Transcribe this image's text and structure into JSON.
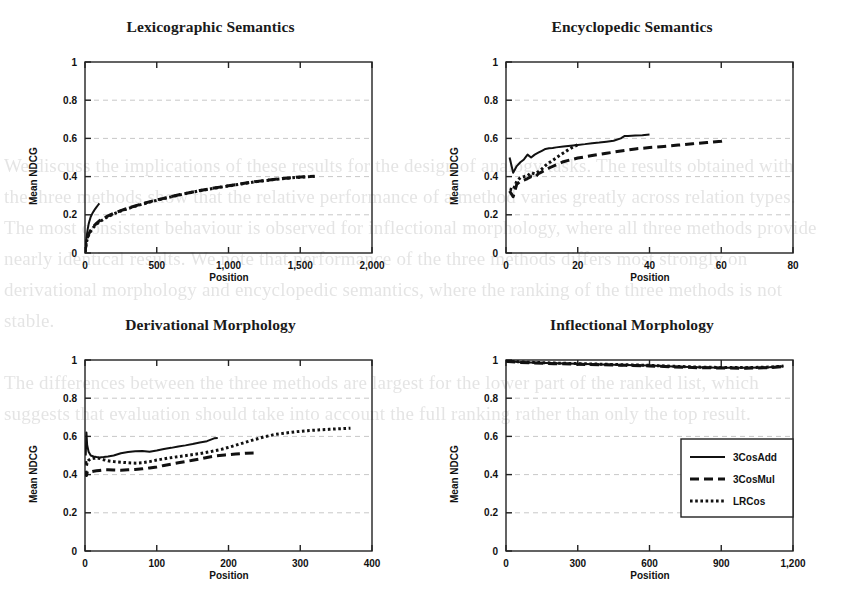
{
  "figure": {
    "background_text": "We discuss the implications of these results for the design of analogy tasks. The results obtained with the three methods show that the relative performance of a method varies greatly across relation types. The most consistent behaviour is observed for inflectional morphology, where all three methods provide nearly identical results. We note that performance of the three methods differs most strongly on derivational morphology and encyclopedic semantics, where the ranking of the three methods is not stable.\n\nThe differences between the three methods are largest for the lower part of the ranked list, which suggests that evaluation should take into account the full ranking rather than only the top result.",
    "series_colors": {
      "line": "#111111",
      "grid": "#c8c8c8",
      "axis": "#222222"
    },
    "legend": {
      "entries": [
        {
          "label": "3CosAdd",
          "style": "solid"
        },
        {
          "label": "3CosMul",
          "style": "dashed"
        },
        {
          "label": "LRCos",
          "style": "dotted"
        }
      ]
    }
  },
  "chart_data": [
    {
      "type": "line",
      "title": "Lexicographic Semantics",
      "xlabel": "Position",
      "ylabel": "Mean NDCG",
      "xlim": [
        0,
        2000
      ],
      "ylim": [
        0,
        1
      ],
      "xticks": [
        0,
        500,
        1000,
        1500,
        2000
      ],
      "xticklabels": [
        "0",
        "500",
        "1,000",
        "1,500",
        "2,000"
      ],
      "yticks": [
        0,
        0.2,
        0.4,
        0.6,
        0.8,
        1
      ],
      "yticklabels": [
        "0",
        "0.2",
        "0.4",
        "0.6",
        "0.8",
        "1"
      ],
      "grid": "horizontal-dashed",
      "legend": "none",
      "series": [
        {
          "name": "3CosAdd",
          "style": "solid",
          "x": [
            1,
            5,
            10,
            15,
            20,
            25,
            30,
            40,
            50,
            60,
            70,
            80,
            90,
            100
          ],
          "y": [
            0.005,
            0.04,
            0.075,
            0.105,
            0.13,
            0.15,
            0.165,
            0.19,
            0.205,
            0.218,
            0.23,
            0.24,
            0.25,
            0.26
          ]
        },
        {
          "name": "3CosMul",
          "style": "dashed",
          "x": [
            1,
            5,
            10,
            20,
            40,
            60,
            80,
            100,
            150,
            200,
            250,
            300,
            400,
            500,
            600,
            700,
            800,
            900,
            1000,
            1100,
            1200,
            1300,
            1400,
            1500,
            1600
          ],
          "y": [
            0.005,
            0.035,
            0.06,
            0.09,
            0.12,
            0.14,
            0.155,
            0.168,
            0.19,
            0.208,
            0.222,
            0.235,
            0.258,
            0.278,
            0.295,
            0.312,
            0.327,
            0.34,
            0.352,
            0.364,
            0.375,
            0.384,
            0.392,
            0.398,
            0.402
          ]
        },
        {
          "name": "LRCos",
          "style": "dotted",
          "x": [
            1,
            5,
            10,
            20,
            40,
            60,
            80,
            100,
            150,
            200,
            250,
            300,
            400,
            500,
            600,
            700,
            800,
            900,
            1000,
            1100,
            1200,
            1300,
            1400,
            1500,
            1600
          ],
          "y": [
            0.004,
            0.03,
            0.055,
            0.085,
            0.115,
            0.135,
            0.15,
            0.163,
            0.186,
            0.205,
            0.22,
            0.233,
            0.256,
            0.276,
            0.294,
            0.311,
            0.326,
            0.339,
            0.351,
            0.363,
            0.374,
            0.383,
            0.391,
            0.397,
            0.401
          ]
        }
      ]
    },
    {
      "type": "line",
      "title": "Encyclopedic Semantics",
      "xlabel": "Position",
      "ylabel": "Mean NDCG",
      "xlim": [
        0,
        80
      ],
      "ylim": [
        0,
        1
      ],
      "xticks": [
        0,
        20,
        40,
        60,
        80
      ],
      "xticklabels": [
        "0",
        "20",
        "40",
        "60",
        "80"
      ],
      "yticks": [
        0,
        0.2,
        0.4,
        0.6,
        0.8,
        1
      ],
      "yticklabels": [
        "0",
        "0.2",
        "0.4",
        "0.6",
        "0.8",
        "1"
      ],
      "grid": "horizontal-dashed",
      "legend": "none",
      "series": [
        {
          "name": "3CosAdd",
          "style": "solid",
          "x": [
            1,
            2,
            3,
            4,
            5,
            6,
            7,
            8,
            9,
            10,
            11,
            12,
            13,
            14,
            16,
            18,
            20,
            22,
            24,
            26,
            28,
            30,
            32,
            33,
            34,
            36,
            38,
            40
          ],
          "y": [
            0.5,
            0.42,
            0.455,
            0.475,
            0.49,
            0.515,
            0.5,
            0.515,
            0.525,
            0.535,
            0.545,
            0.548,
            0.55,
            0.553,
            0.558,
            0.562,
            0.566,
            0.57,
            0.575,
            0.578,
            0.583,
            0.588,
            0.6,
            0.612,
            0.613,
            0.615,
            0.617,
            0.62
          ]
        },
        {
          "name": "3CosMul",
          "style": "dashed",
          "x": [
            1,
            2,
            3,
            4,
            5,
            6,
            7,
            8,
            9,
            10,
            12,
            14,
            16,
            18,
            20,
            24,
            28,
            32,
            36,
            40,
            44,
            48,
            52,
            56,
            60,
            61
          ],
          "y": [
            0.325,
            0.295,
            0.36,
            0.375,
            0.382,
            0.39,
            0.4,
            0.395,
            0.415,
            0.425,
            0.445,
            0.462,
            0.478,
            0.488,
            0.497,
            0.51,
            0.522,
            0.534,
            0.545,
            0.552,
            0.558,
            0.565,
            0.572,
            0.578,
            0.585,
            0.59
          ]
        },
        {
          "name": "LRCos",
          "style": "dotted",
          "x": [
            1,
            2,
            3,
            4,
            5,
            6,
            7,
            8,
            9,
            10,
            11,
            12,
            13,
            14,
            15,
            16,
            17,
            18,
            19,
            20
          ],
          "y": [
            0.335,
            0.33,
            0.375,
            0.395,
            0.4,
            0.405,
            0.42,
            0.415,
            0.425,
            0.44,
            0.458,
            0.472,
            0.485,
            0.498,
            0.512,
            0.524,
            0.536,
            0.548,
            0.558,
            0.566
          ]
        }
      ]
    },
    {
      "type": "line",
      "title": "Derivational Morphology",
      "xlabel": "Position",
      "ylabel": "Mean NDCG",
      "xlim": [
        0,
        400
      ],
      "ylim": [
        0,
        1
      ],
      "xticks": [
        0,
        100,
        200,
        300,
        400
      ],
      "xticklabels": [
        "0",
        "100",
        "200",
        "300",
        "400"
      ],
      "yticks": [
        0,
        0.2,
        0.4,
        0.6,
        0.8,
        1
      ],
      "yticklabels": [
        "0",
        "0.2",
        "0.4",
        "0.6",
        "0.8",
        "1"
      ],
      "grid": "horizontal-dashed",
      "legend": "none",
      "series": [
        {
          "name": "3CosAdd",
          "style": "solid",
          "x": [
            1,
            2,
            3,
            5,
            8,
            12,
            16,
            20,
            26,
            32,
            40,
            50,
            60,
            70,
            80,
            90,
            100,
            110,
            120,
            130,
            140,
            150,
            160,
            170,
            180,
            185
          ],
          "y": [
            0.5,
            0.62,
            0.555,
            0.52,
            0.5,
            0.495,
            0.492,
            0.49,
            0.492,
            0.495,
            0.5,
            0.512,
            0.518,
            0.522,
            0.524,
            0.52,
            0.526,
            0.534,
            0.54,
            0.547,
            0.553,
            0.56,
            0.568,
            0.575,
            0.59,
            0.592
          ]
        },
        {
          "name": "3CosMul",
          "style": "dashed",
          "x": [
            1,
            2,
            3,
            5,
            8,
            12,
            16,
            20,
            26,
            32,
            40,
            50,
            60,
            70,
            80,
            90,
            100,
            110,
            120,
            130,
            140,
            150,
            160,
            170,
            180,
            195,
            210,
            225,
            235
          ],
          "y": [
            0.42,
            0.395,
            0.41,
            0.405,
            0.415,
            0.418,
            0.42,
            0.422,
            0.425,
            0.425,
            0.424,
            0.423,
            0.425,
            0.427,
            0.43,
            0.435,
            0.44,
            0.448,
            0.455,
            0.462,
            0.468,
            0.475,
            0.482,
            0.49,
            0.497,
            0.503,
            0.508,
            0.512,
            0.513
          ]
        },
        {
          "name": "LRCos",
          "style": "dotted",
          "x": [
            1,
            2,
            3,
            5,
            8,
            12,
            16,
            20,
            26,
            32,
            40,
            50,
            60,
            70,
            80,
            90,
            100,
            115,
            130,
            145,
            160,
            175,
            190,
            205,
            220,
            235,
            250,
            265,
            280,
            295,
            310,
            325,
            340,
            355,
            370
          ],
          "y": [
            0.47,
            0.445,
            0.465,
            0.475,
            0.482,
            0.485,
            0.487,
            0.485,
            0.478,
            0.472,
            0.468,
            0.465,
            0.462,
            0.46,
            0.462,
            0.468,
            0.476,
            0.486,
            0.494,
            0.502,
            0.51,
            0.52,
            0.532,
            0.548,
            0.565,
            0.582,
            0.598,
            0.61,
            0.618,
            0.625,
            0.63,
            0.634,
            0.637,
            0.64,
            0.643
          ]
        }
      ]
    },
    {
      "type": "line",
      "title": "Inflectional Morphology",
      "xlabel": "Position",
      "ylabel": "Mean NDCG",
      "xlim": [
        0,
        1200
      ],
      "ylim": [
        0,
        1
      ],
      "xticks": [
        0,
        300,
        600,
        900,
        1200
      ],
      "xticklabels": [
        "0",
        "300",
        "600",
        "900",
        "1,200"
      ],
      "yticks": [
        0,
        0.2,
        0.4,
        0.6,
        0.8,
        1
      ],
      "yticklabels": [
        "0",
        "0.2",
        "0.4",
        "0.6",
        "0.8",
        "1"
      ],
      "grid": "horizontal-dashed",
      "legend": "bottom-right",
      "series": [
        {
          "name": "3CosAdd",
          "style": "solid",
          "x": [
            1,
            50,
            100,
            200,
            300,
            400,
            500,
            600,
            700,
            800,
            900,
            1000,
            1100,
            1160
          ],
          "y": [
            0.995,
            0.99,
            0.987,
            0.983,
            0.98,
            0.977,
            0.974,
            0.971,
            0.966,
            0.962,
            0.96,
            0.959,
            0.962,
            0.967
          ]
        },
        {
          "name": "3CosMul",
          "style": "dashed",
          "x": [
            1,
            50,
            100,
            200,
            300,
            400,
            500,
            600,
            700,
            800,
            900,
            1000,
            1100,
            1160
          ],
          "y": [
            0.993,
            0.988,
            0.985,
            0.981,
            0.978,
            0.975,
            0.972,
            0.969,
            0.964,
            0.96,
            0.958,
            0.957,
            0.96,
            0.965
          ]
        },
        {
          "name": "LRCos",
          "style": "dotted",
          "x": [
            1,
            50,
            100,
            200,
            300,
            400,
            500,
            600,
            700,
            800,
            900,
            1000,
            1100,
            1160
          ],
          "y": [
            0.996,
            0.991,
            0.988,
            0.984,
            0.981,
            0.978,
            0.975,
            0.972,
            0.967,
            0.963,
            0.961,
            0.96,
            0.963,
            0.968
          ]
        }
      ]
    }
  ]
}
